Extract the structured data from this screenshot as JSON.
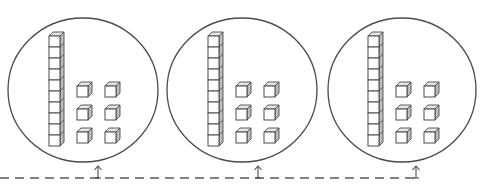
{
  "diagram": {
    "description": "Three circled groups of base-ten blocks, each with one ten-rod and six unit cubes, linked by a dashed line with upward arrows",
    "colors": {
      "background": "#ffffff",
      "stroke": "#4a4a4a",
      "cube_face": "#ffffff",
      "cube_side": "#bdbdbd",
      "cube_top": "#e6e6e6",
      "dash": "#5a5a5a"
    },
    "groups": [
      {
        "label": "group-1",
        "tens": 1,
        "ones": 6,
        "cx": 83,
        "cy": 90,
        "rx": 75,
        "ry": 72,
        "rod_x": 49,
        "ones_x": 77,
        "arrow_x": 98
      },
      {
        "label": "group-2",
        "tens": 1,
        "ones": 6,
        "cx": 242,
        "cy": 90,
        "rx": 75,
        "ry": 72,
        "rod_x": 208,
        "ones_x": 236,
        "arrow_x": 258
      },
      {
        "label": "group-3",
        "tens": 1,
        "ones": 6,
        "cx": 402,
        "cy": 90,
        "rx": 74,
        "ry": 72,
        "rod_x": 368,
        "ones_x": 396,
        "arrow_x": 416
      }
    ],
    "rod": {
      "units": 10,
      "unit_h": 11,
      "width": 11,
      "top_y": 36,
      "depth": 4
    },
    "ones_grid": {
      "cols": 2,
      "rows": 3,
      "size": 11,
      "col_gap": 28,
      "row_ys": [
        86,
        109,
        132
      ],
      "depth": 4
    },
    "connector": {
      "y": 178,
      "x_start": 0,
      "x_end": 418,
      "dash": "9 6",
      "arrow_top": 166
    }
  }
}
